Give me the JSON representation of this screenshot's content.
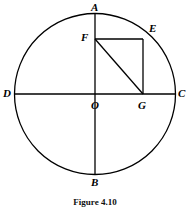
{
  "figure": {
    "caption": "Figure 4.10",
    "kind": "geometry-diagram",
    "stroke_color": "#000000",
    "background_color": "#ffffff",
    "stroke_width": 1.3
  },
  "circle": {
    "name": "main-circle",
    "center_x": 95,
    "center_y": 94,
    "radius": 80.5
  },
  "diameters": [
    {
      "name": "vertical-diameter",
      "from": "A",
      "to": "B",
      "x1": 95,
      "y1": 13.5,
      "x2": 95,
      "y2": 174.5
    },
    {
      "name": "horizontal-diameter",
      "from": "D",
      "to": "C",
      "x1": 14.5,
      "y1": 94,
      "x2": 175.5,
      "y2": 94
    }
  ],
  "rectangle": {
    "name": "rectangle-OFEG",
    "vertices": [
      "O",
      "F",
      "E",
      "G"
    ],
    "left": 95,
    "top": 39,
    "right": 143,
    "bottom": 94,
    "width": 48,
    "height": 55
  },
  "diagonal": {
    "name": "diagonal-FG",
    "from": "F",
    "to": "G",
    "x1": 95,
    "y1": 39,
    "x2": 143,
    "y2": 94
  },
  "points": [
    {
      "id": "A",
      "label": "A",
      "x": 95,
      "y": 13.5,
      "label_x": 91,
      "label_y": 2,
      "note": "top of circle"
    },
    {
      "id": "E",
      "label": "E",
      "x": 143,
      "y": 39,
      "label_x": 149,
      "label_y": 23,
      "note": "on circle, top-right of rectangle"
    },
    {
      "id": "F",
      "label": "F",
      "x": 95,
      "y": 39,
      "label_x": 81,
      "label_y": 32,
      "note": "top-left of rectangle on OA"
    },
    {
      "id": "D",
      "label": "D",
      "x": 14.5,
      "y": 94,
      "label_x": 3,
      "label_y": 88,
      "note": "left of circle"
    },
    {
      "id": "C",
      "label": "C",
      "x": 175.5,
      "y": 94,
      "label_x": 178,
      "label_y": 88,
      "note": "right of circle"
    },
    {
      "id": "O",
      "label": "O",
      "x": 95,
      "y": 94,
      "label_x": 91,
      "label_y": 100,
      "note": "center"
    },
    {
      "id": "G",
      "label": "G",
      "x": 143,
      "y": 94,
      "label_x": 138,
      "label_y": 100,
      "note": "on OC, bottom-right of rectangle"
    },
    {
      "id": "B",
      "label": "B",
      "x": 95,
      "y": 174.5,
      "label_x": 91,
      "label_y": 177,
      "note": "bottom of circle"
    }
  ]
}
